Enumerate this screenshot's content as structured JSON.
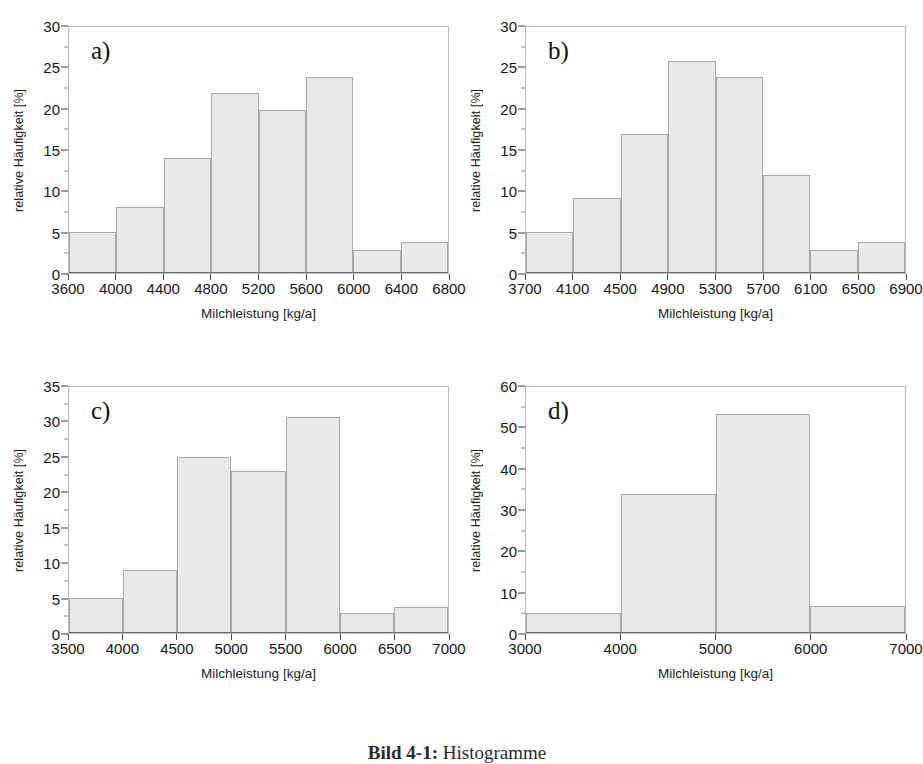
{
  "figure": {
    "caption_label": "Bild 4-1:",
    "caption_text": "Histogramme"
  },
  "axis_titles": {
    "x": "Milchleistung [kg/a]",
    "y": "relative Häufigkeit [%]"
  },
  "colors": {
    "bar_fill": "#e9e9e9",
    "bar_edge": "#a8a8a8",
    "axis": "#4a4a4a",
    "frame": "#b9b9b9",
    "text": "#161616"
  },
  "chart_data": [
    {
      "type": "bar",
      "panel": "a",
      "label": "a)",
      "title": "",
      "xlabel": "Milchleistung [kg/a]",
      "ylabel": "relative Häufigkeit [%]",
      "xlim": [
        3600,
        6800
      ],
      "ylim": [
        0,
        30
      ],
      "bin_width": 400,
      "xticks": [
        3600,
        4000,
        4400,
        4800,
        5200,
        5600,
        6000,
        6400,
        6800
      ],
      "yticks": [
        0,
        5,
        10,
        15,
        20,
        25,
        30
      ],
      "grid": false,
      "legend": "none",
      "bin_edges": [
        3600,
        4000,
        4400,
        4800,
        5200,
        5600,
        6000,
        6400,
        6800
      ],
      "categories": [
        "3600-4000",
        "4000-4400",
        "4400-4800",
        "4800-5200",
        "5200-5600",
        "5600-6000",
        "6000-6400",
        "6400-6800"
      ],
      "values": [
        5.0,
        8.0,
        14.0,
        21.9,
        19.9,
        23.9,
        2.8,
        3.8
      ]
    },
    {
      "type": "bar",
      "panel": "b",
      "label": "b)",
      "title": "",
      "xlabel": "Milchleistung [kg/a]",
      "ylabel": "relative Häufigkeit [%]",
      "xlim": [
        3700,
        6900
      ],
      "ylim": [
        0,
        30
      ],
      "bin_width": 400,
      "xticks": [
        3700,
        4100,
        4500,
        4900,
        5300,
        5700,
        6100,
        6500,
        6900
      ],
      "yticks": [
        0,
        5,
        10,
        15,
        20,
        25,
        30
      ],
      "grid": false,
      "legend": "none",
      "bin_edges": [
        3700,
        4100,
        4500,
        4900,
        5300,
        5700,
        6100,
        6500,
        6900
      ],
      "categories": [
        "3700-4100",
        "4100-4500",
        "4500-4900",
        "4900-5300",
        "5300-5700",
        "5700-6100",
        "6100-6500",
        "6500-6900"
      ],
      "values": [
        5.0,
        9.1,
        17.0,
        25.9,
        23.9,
        11.9,
        2.8,
        3.8
      ]
    },
    {
      "type": "bar",
      "panel": "c",
      "label": "c)",
      "title": "",
      "xlabel": "Milchleistung [kg/a]",
      "ylabel": "relative Häufigkeit [%]",
      "xlim": [
        3500,
        7000
      ],
      "ylim": [
        0,
        35
      ],
      "bin_width": 500,
      "xticks": [
        3500,
        4000,
        4500,
        5000,
        5500,
        6000,
        6500,
        7000
      ],
      "yticks": [
        0,
        5,
        10,
        15,
        20,
        25,
        30,
        35
      ],
      "grid": false,
      "legend": "none",
      "bin_edges": [
        3500,
        4000,
        4500,
        5000,
        5500,
        6000,
        6500,
        7000
      ],
      "categories": [
        "3500-4000",
        "4000-4500",
        "4500-5000",
        "5000-5500",
        "5500-6000",
        "6000-6500",
        "6500-7000"
      ],
      "values": [
        5.0,
        9.0,
        25.0,
        23.0,
        30.8,
        2.8,
        3.7
      ]
    },
    {
      "type": "bar",
      "panel": "d",
      "label": "d)",
      "title": "",
      "xlabel": "Milchleistung [kg/a]",
      "ylabel": "relative Häufigkeit [%]",
      "xlim": [
        3000,
        7000
      ],
      "ylim": [
        0,
        60
      ],
      "bin_width": 1000,
      "xticks": [
        3000,
        4000,
        5000,
        6000,
        7000
      ],
      "yticks": [
        0,
        10,
        20,
        30,
        40,
        50,
        60
      ],
      "grid": false,
      "legend": "none",
      "bin_edges": [
        3000,
        4000,
        5000,
        6000,
        7000
      ],
      "categories": [
        "3000-4000",
        "4000-5000",
        "5000-6000",
        "6000-7000"
      ],
      "values": [
        5.0,
        34.0,
        53.5,
        6.5
      ]
    }
  ]
}
